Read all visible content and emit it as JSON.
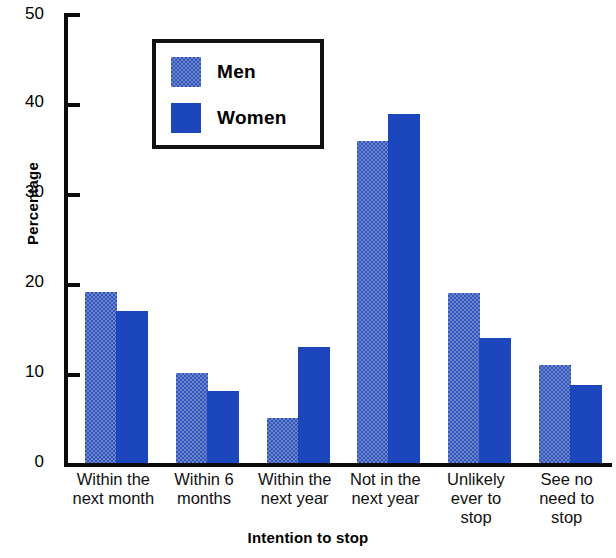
{
  "chart_data": {
    "type": "bar",
    "title": "",
    "xlabel": "Intention to stop",
    "ylabel": "Percentage",
    "ylim": [
      0,
      50
    ],
    "yticks": [
      0,
      10,
      20,
      30,
      40,
      50
    ],
    "grid": false,
    "legend_position": "upper-left-inside",
    "categories": [
      "Within the next month",
      "Within 6 months",
      "Within the next year",
      "Not in the next year",
      "Unlikely ever to stop",
      "See no need to stop"
    ],
    "category_lines": [
      [
        "Within the",
        "next month"
      ],
      [
        "Within 6",
        "months"
      ],
      [
        "Within the",
        "next year"
      ],
      [
        "Not in the",
        "next year"
      ],
      [
        "Unlikely",
        "ever to",
        "stop"
      ],
      [
        "See no",
        "need to",
        "stop"
      ]
    ],
    "series": [
      {
        "name": "Men",
        "color": "#6f86cf",
        "values": [
          19.0,
          10.0,
          5.0,
          35.8,
          18.9,
          10.9
        ]
      },
      {
        "name": "Women",
        "color": "#1c46bc",
        "values": [
          16.9,
          8.0,
          12.9,
          38.8,
          13.9,
          8.7
        ]
      }
    ]
  },
  "axis": {
    "y_title": "Percentage",
    "x_title": "Intention to stop",
    "y_labels": [
      "50",
      "40",
      "30",
      "20",
      "10",
      "0"
    ]
  },
  "legend": {
    "items": [
      {
        "label": "Men"
      },
      {
        "label": "Women"
      }
    ]
  }
}
